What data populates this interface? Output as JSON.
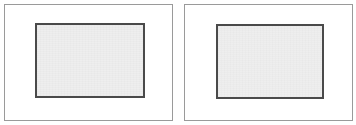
{
  "figure": {
    "title": "",
    "canvas": {
      "width": 356,
      "height": 125,
      "background_color": "#ffffff"
    },
    "panels": [
      {
        "id": "panel-left",
        "label": "",
        "frame": {
          "x": 4,
          "y": 4,
          "width": 169,
          "height": 117,
          "border_color": "#9a9a9a",
          "border_width": 1,
          "background_color": "#ffffff"
        },
        "inner_rect": {
          "x": 30,
          "y": 18,
          "width": 110,
          "height": 75,
          "fill_color": "#eeeeee",
          "border_color": "#4a4a4a",
          "border_width": 2
        }
      },
      {
        "id": "panel-right",
        "label": "",
        "frame": {
          "x": 184,
          "y": 4,
          "width": 169,
          "height": 117,
          "border_color": "#9a9a9a",
          "border_width": 1,
          "background_color": "#ffffff"
        },
        "inner_rect": {
          "x": 31,
          "y": 19,
          "width": 108,
          "height": 75,
          "fill_color": "#eeeeee",
          "border_color": "#4a4a4a",
          "border_width": 2
        }
      }
    ]
  }
}
